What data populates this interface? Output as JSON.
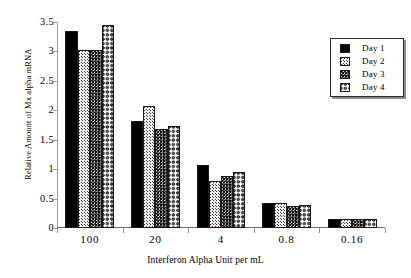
{
  "chart_data": {
    "type": "bar",
    "title": "",
    "xlabel": "Interferon Alpha Unit per mL",
    "ylabel": "Relative Amount of Mx alpha mRNA",
    "categories": [
      "100",
      "20",
      "4",
      "0.8",
      "0.16"
    ],
    "ylim": [
      0,
      3.5
    ],
    "yticks": [
      "0",
      "0.5",
      "1",
      "1.5",
      "2",
      "2.5",
      "3",
      "3.5"
    ],
    "ytick_values": [
      0,
      0.5,
      1,
      1.5,
      2,
      2.5,
      3,
      3.5
    ],
    "grid": false,
    "legend_position": "top-right",
    "series": [
      {
        "name": "Day 1",
        "pattern": "solid-black",
        "values": [
          3.35,
          1.82,
          1.07,
          0.42,
          0.15
        ]
      },
      {
        "name": "Day 2",
        "pattern": "light-dots",
        "values": [
          3.02,
          2.07,
          0.8,
          0.42,
          0.16
        ]
      },
      {
        "name": "Day 3",
        "pattern": "dense-dark-dots",
        "values": [
          3.02,
          1.69,
          0.88,
          0.37,
          0.15
        ]
      },
      {
        "name": "Day 4",
        "pattern": "cross-hatch",
        "values": [
          3.45,
          1.73,
          0.95,
          0.39,
          0.15
        ]
      }
    ]
  },
  "legend": {
    "items": [
      {
        "label": "Day 1"
      },
      {
        "label": "Day 2"
      },
      {
        "label": "Day 3"
      },
      {
        "label": "Day 4"
      }
    ]
  },
  "colors": {
    "axis": "#6b6b6b",
    "bar_outline": "#1a1a1a",
    "text": "#000000",
    "background": "#ffffff"
  }
}
